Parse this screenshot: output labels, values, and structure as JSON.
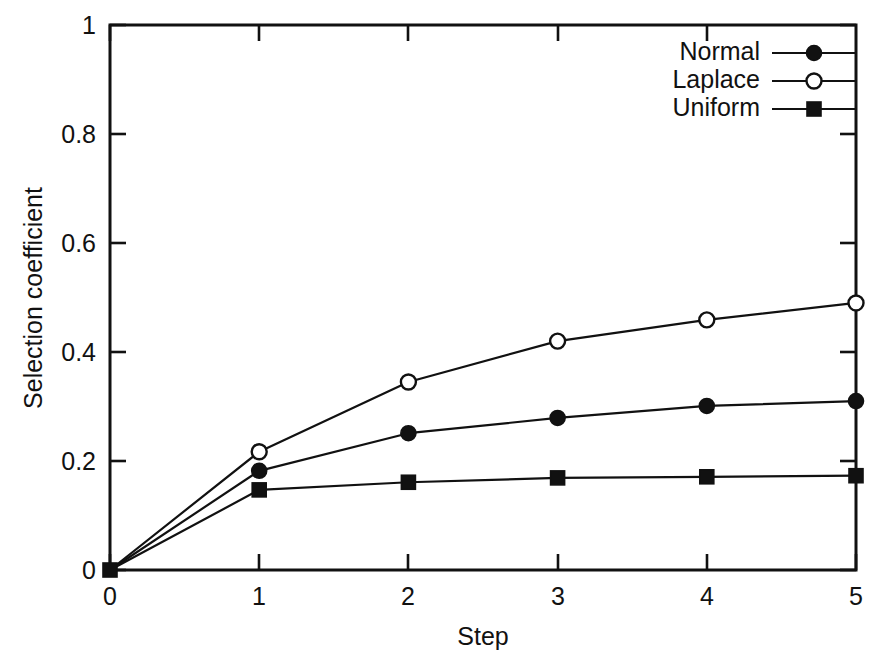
{
  "chart_data": {
    "type": "line",
    "title": "",
    "subtitle": "",
    "xlabel": "Step",
    "ylabel": "Selection coefficient",
    "x": [
      0,
      1,
      2,
      3,
      4,
      5
    ],
    "xlim": [
      0,
      5
    ],
    "ylim": [
      0,
      1
    ],
    "xticks": [
      "0",
      "1",
      "2",
      "3",
      "4",
      "5"
    ],
    "yticks": [
      "0",
      "0.2",
      "0.4",
      "0.6",
      "0.8",
      "1"
    ],
    "grid": false,
    "legend_position": "top-right",
    "series": [
      {
        "name": "Normal",
        "marker": "filled-circle",
        "color": "#111111",
        "values": [
          0.0,
          0.182,
          0.251,
          0.279,
          0.301,
          0.31
        ]
      },
      {
        "name": "Laplace",
        "marker": "open-circle",
        "color": "#111111",
        "values": [
          0.0,
          0.217,
          0.345,
          0.42,
          0.459,
          0.49
        ]
      },
      {
        "name": "Uniform",
        "marker": "filled-square",
        "color": "#111111",
        "values": [
          0.0,
          0.147,
          0.161,
          0.169,
          0.171,
          0.173
        ]
      }
    ]
  },
  "axes": {
    "x_title": "Step",
    "y_title": "Selection coefficient",
    "x_tick_labels": [
      "0",
      "1",
      "2",
      "3",
      "4",
      "5"
    ],
    "y_tick_labels": [
      "0",
      "0.2",
      "0.4",
      "0.6",
      "0.8",
      "1"
    ]
  },
  "legend": {
    "entries": [
      {
        "label": "Normal",
        "marker": "filled-circle"
      },
      {
        "label": "Laplace",
        "marker": "open-circle"
      },
      {
        "label": "Uniform",
        "marker": "filled-square"
      }
    ]
  },
  "colors": {
    "foreground": "#111111",
    "background": "#ffffff"
  }
}
